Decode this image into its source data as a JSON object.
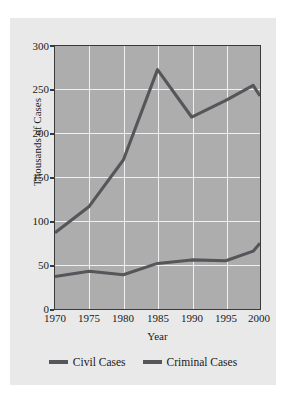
{
  "chart_data": {
    "type": "line",
    "title": "",
    "xlabel": "Year",
    "ylabel": "Thousands of Cases",
    "x": [
      1970,
      1975,
      1980,
      1985,
      1990,
      1995,
      1999,
      2000
    ],
    "xticks": [
      "1970",
      "1975",
      "1980",
      "1985",
      "1990",
      "1995",
      "2000"
    ],
    "yticks": [
      "0",
      "50",
      "100",
      "150",
      "200",
      "250",
      "300"
    ],
    "xlim": [
      1970,
      2000
    ],
    "ylim": [
      0,
      300
    ],
    "grid": true,
    "legend_position": "bottom",
    "series": [
      {
        "name": "Civil Cases",
        "color": "#55555a",
        "values": [
          87,
          117,
          170,
          273,
          219,
          238,
          255,
          243
        ]
      },
      {
        "name": "Criminal Cases",
        "color": "#55555a",
        "values": [
          37,
          43,
          39,
          52,
          56,
          55,
          66,
          75
        ]
      }
    ]
  },
  "legend": {
    "items": [
      {
        "label": "Civil Cases"
      },
      {
        "label": "Criminal Cases"
      }
    ]
  },
  "colors": {
    "page_background": "#ffffff",
    "card_background": "#e9e9e9",
    "plot_background": "#adadad",
    "gridline": "#f0f0f0",
    "axis": "#3a3a3a",
    "line": "#55555a",
    "text": "#1a1a1a"
  }
}
